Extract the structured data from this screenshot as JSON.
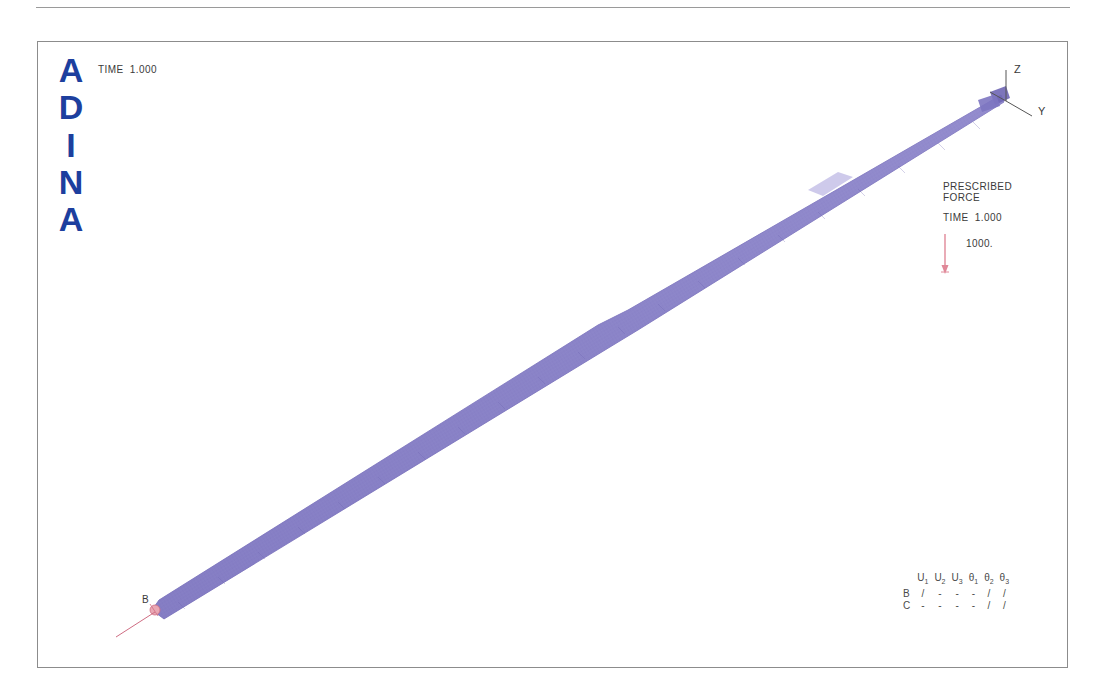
{
  "page": {
    "background": "#ffffff",
    "rule_color": "#9a9a9a"
  },
  "plot": {
    "frame_color": "#8c8c8c",
    "background": "#ffffff",
    "logo": {
      "letters": [
        "A",
        "D",
        "I",
        "N",
        "A"
      ],
      "color": "#1d3f9e"
    },
    "time_label": "TIME  1.000",
    "axis_triad": {
      "z_label": "Z",
      "y_label": "Y",
      "color": "#555555"
    },
    "legend": {
      "title_line1": "PRESCRIBED",
      "title_line2": "FORCE",
      "time_label": "TIME  1.000",
      "magnitude": "1000.",
      "arrow_color": "#e08898"
    },
    "node_labels": [
      {
        "name": "B",
        "text": "B"
      }
    ],
    "support_color": "#e08898",
    "mesh": {
      "fill_color": "#8b84c8",
      "edge_color": "#6f66b4",
      "highlight_color": "#b3aede",
      "start_point": [
        115,
        566
      ],
      "end_point": [
        963,
        54
      ],
      "description": "tapered slender beam mesh from lower-left to upper-right"
    },
    "bc_table": {
      "headers": [
        "U",
        "U",
        "U",
        "θ",
        "θ",
        "θ"
      ],
      "header_subs": [
        "1",
        "2",
        "3",
        "1",
        "2",
        "3"
      ],
      "rows": [
        {
          "label": "B",
          "cells": [
            "/",
            "-",
            "-",
            "-",
            "/",
            "/"
          ]
        },
        {
          "label": "C",
          "cells": [
            "-",
            "-",
            "-",
            "-",
            "/",
            "/"
          ]
        }
      ]
    }
  }
}
